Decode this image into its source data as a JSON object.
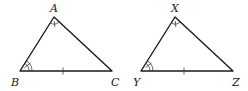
{
  "diagram": {
    "triangles": [
      {
        "name": "ABC",
        "vertices": {
          "top": {
            "label": "A",
            "x": 54,
            "y": 17
          },
          "left": {
            "label": "B",
            "x": 20,
            "y": 71
          },
          "right": {
            "label": "C",
            "x": 112,
            "y": 71
          }
        },
        "markings": {
          "top_angle": "single arc with tick",
          "left_angle": "double arc with tick",
          "base_side": "single tick"
        }
      },
      {
        "name": "XYZ",
        "vertices": {
          "top": {
            "label": "X",
            "x": 175,
            "y": 17
          },
          "left": {
            "label": "Y",
            "x": 141,
            "y": 71
          },
          "right": {
            "label": "Z",
            "x": 233,
            "y": 71
          }
        },
        "markings": {
          "top_angle": "single arc with tick",
          "left_angle": "double arc with tick",
          "base_side": "single tick"
        }
      }
    ],
    "colors": {
      "stroke": "#1a1a1a",
      "background": "#ffffff"
    }
  }
}
